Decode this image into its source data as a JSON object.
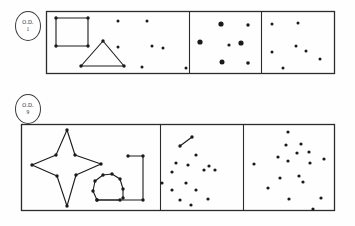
{
  "figure": {
    "title": "",
    "background_color": "#fefefe",
    "ink_color": "#1a1a1a",
    "frame_color": "#2b2b2b",
    "width": 355,
    "height": 226
  },
  "rows": [
    {
      "id": "row-1",
      "label": {
        "top_text": "O.D.",
        "bottom_text": "1"
      },
      "frame": {
        "x": 46,
        "y": 11,
        "width": 288,
        "height": 62
      },
      "dividers": [
        189,
        261
      ],
      "panels": [
        {
          "id": "row1-panel-left",
          "name": "square-and-triangle-panel",
          "shapes": [
            {
              "type": "polygon",
              "name": "square-outline",
              "closed": true,
              "points": [
                [
                  56,
                  18
                ],
                [
                  88,
                  18
                ],
                [
                  88,
                  46
                ],
                [
                  56,
                  46
                ]
              ],
              "vertex_dots": true
            },
            {
              "type": "polygon",
              "name": "triangle-outline",
              "closed": true,
              "points": [
                [
                  103,
                  41
                ],
                [
                  124,
                  66
                ],
                [
                  81,
                  66
                ]
              ],
              "vertex_dots": true
            }
          ],
          "dots": [
            [
              118,
              21
            ],
            [
              147,
              21
            ],
            [
              118,
              47
            ],
            [
              152,
              46
            ],
            [
              163,
              48
            ],
            [
              142,
              67
            ],
            [
              186,
              68
            ]
          ],
          "dot_radius": 1.5
        },
        {
          "id": "row1-panel-middle",
          "name": "large-dots-panel",
          "shapes": [],
          "dots": [
            [
              221,
              24
            ],
            [
              248,
              25
            ],
            [
              200,
              42
            ],
            [
              229,
              45
            ],
            [
              241,
              43
            ],
            [
              222,
              62
            ],
            [
              248,
              63
            ]
          ],
          "dot_radius": 2.5,
          "dot_radius_variants": [
            2.6,
            1.7,
            2.6,
            1.6,
            2.6,
            2.5,
            1.8
          ]
        },
        {
          "id": "row1-panel-right",
          "name": "small-dots-panel",
          "shapes": [],
          "dots": [
            [
              272,
              24
            ],
            [
              298,
              23
            ],
            [
              296,
              46
            ],
            [
              306,
              51
            ],
            [
              272,
              52
            ],
            [
              320,
              59
            ],
            [
              283,
              68
            ]
          ],
          "dot_radius": 1.5
        }
      ]
    },
    {
      "id": "row-2",
      "label": {
        "top_text": "O.D.",
        "bottom_text": "9"
      },
      "frame": {
        "x": 21,
        "y": 124,
        "width": 313,
        "height": 86
      },
      "dividers": [
        160,
        243
      ],
      "panels": [
        {
          "id": "row2-panel-left",
          "name": "star-arch-bracket-panel",
          "shapes": [
            {
              "type": "polygon",
              "name": "four-pointed-star-outline",
              "closed": true,
              "points": [
                [
                  67,
                  130
                ],
                [
                  75,
                  155
                ],
                [
                  101,
                  164
                ],
                [
                  76,
                  175
                ],
                [
                  67,
                  206
                ],
                [
                  57,
                  176
                ],
                [
                  32,
                  165
                ],
                [
                  56,
                  155
                ]
              ],
              "vertex_dots": true
            },
            {
              "type": "polyline",
              "name": "arch-omega-outline",
              "closed": false,
              "points": [
                [
                  120,
                  200
                ],
                [
                  97,
                  200
                ],
                [
                  93,
                  191
                ],
                [
                  95,
                  181
                ],
                [
                  103,
                  175
                ],
                [
                  112,
                  174
                ],
                [
                  120,
                  179
                ],
                [
                  123,
                  189
                ],
                [
                  123,
                  198
                ]
              ],
              "vertex_dots": true
            },
            {
              "type": "polyline",
              "name": "bracket-outline",
              "closed": false,
              "points": [
                [
                  128,
                  156
                ],
                [
                  143,
                  156
                ],
                [
                  143,
                  200
                ],
                [
                  97,
                  200
                ]
              ],
              "vertex_dots": true
            }
          ],
          "dots": [],
          "dot_radius": 1.6
        },
        {
          "id": "row2-panel-middle",
          "name": "scatter-with-segment-panel",
          "shapes": [
            {
              "type": "polyline",
              "name": "two-dot-connector-segment",
              "closed": false,
              "points": [
                [
                  180,
                  146
                ],
                [
                  192,
                  137
                ]
              ],
              "vertex_dots": true
            }
          ],
          "dots": [
            [
              196,
              155
            ],
            [
              176,
              163
            ],
            [
              188,
              165
            ],
            [
              172,
              172
            ],
            [
              209,
              166
            ],
            [
              204,
              170
            ],
            [
              215,
              170
            ],
            [
              162,
              183
            ],
            [
              186,
              183
            ],
            [
              172,
              190
            ],
            [
              196,
              190
            ],
            [
              180,
              200
            ],
            [
              208,
              199
            ],
            [
              191,
              205
            ]
          ],
          "dot_radius": 1.6
        },
        {
          "id": "row2-panel-right",
          "name": "dense-scatter-panel",
          "shapes": [],
          "dots": [
            [
              288,
              132
            ],
            [
              286,
              145
            ],
            [
              301,
              144
            ],
            [
              278,
              157
            ],
            [
              297,
              153
            ],
            [
              309,
              152
            ],
            [
              254,
              164
            ],
            [
              288,
              161
            ],
            [
              310,
              163
            ],
            [
              324,
              159
            ],
            [
              280,
              178
            ],
            [
              299,
              176
            ],
            [
              303,
              182
            ],
            [
              268,
              188
            ],
            [
              289,
              199
            ],
            [
              321,
              198
            ],
            [
              313,
              209
            ]
          ],
          "dot_radius": 1.6
        }
      ]
    }
  ]
}
